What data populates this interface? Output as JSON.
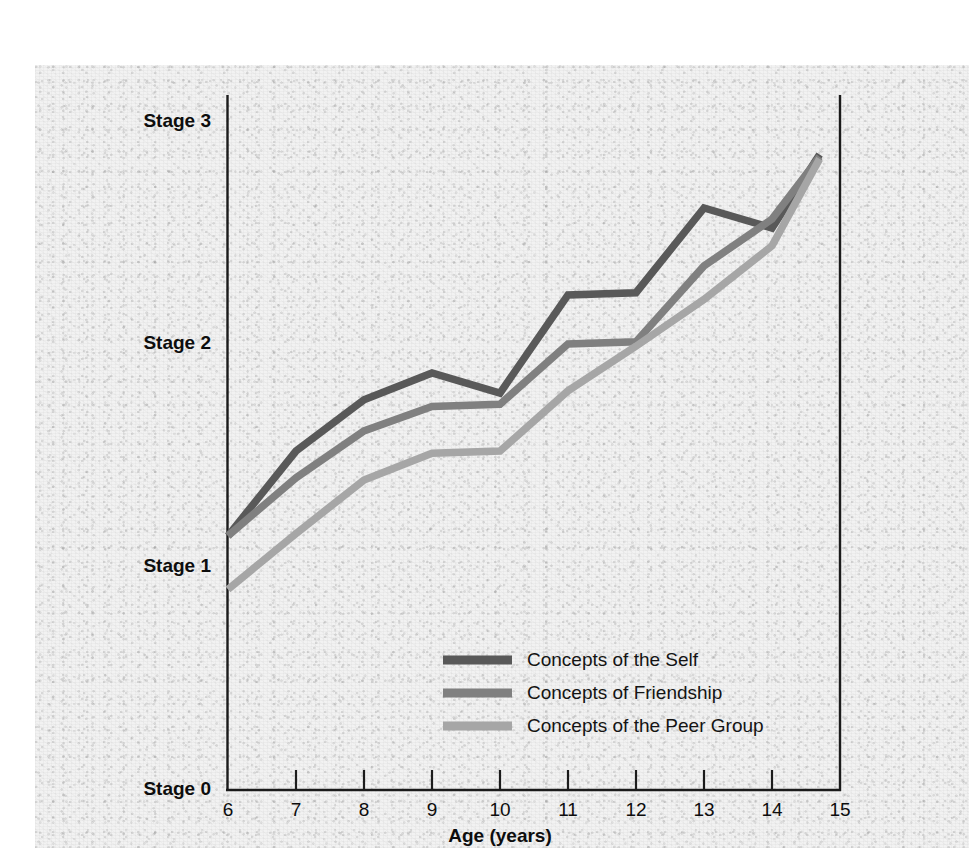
{
  "chart_data": {
    "type": "line",
    "title": "",
    "xlabel": "Age (years)",
    "ylabel": "",
    "x": [
      6,
      7,
      8,
      9,
      10,
      11,
      12,
      13,
      14,
      14.7
    ],
    "xlim": [
      6,
      15
    ],
    "ylim": [
      0,
      3
    ],
    "grid": false,
    "legend_position": "inside-bottom-center",
    "xtick_labels": [
      "6",
      "7",
      "8",
      "9",
      "10",
      "11",
      "12",
      "13",
      "14",
      "15"
    ],
    "ytick_labels": [
      "Stage 0",
      "Stage 1",
      "Stage 2",
      "Stage 3"
    ],
    "ytick_values": [
      0,
      1,
      2,
      3
    ],
    "series": [
      {
        "name": "Concepts of the Self",
        "color": "#595959",
        "values": [
          1.14,
          1.52,
          1.75,
          1.87,
          1.78,
          2.22,
          2.23,
          2.61,
          2.52,
          2.85
        ]
      },
      {
        "name": "Concepts of Friendship",
        "color": "#808080",
        "values": [
          1.14,
          1.4,
          1.61,
          1.72,
          1.73,
          2.0,
          2.01,
          2.35,
          2.56,
          2.84
        ]
      },
      {
        "name": "Concepts of the Peer Group",
        "color": "#a6a6a6",
        "values": [
          0.9,
          1.15,
          1.39,
          1.51,
          1.52,
          1.79,
          1.99,
          2.2,
          2.44,
          2.83
        ]
      }
    ]
  },
  "yaxis": {
    "labels": [
      {
        "text": "Stage 3",
        "value": 3
      },
      {
        "text": "Stage 2",
        "value": 2
      },
      {
        "text": "Stage 1",
        "value": 1
      },
      {
        "text": "Stage 0",
        "value": 0
      }
    ]
  },
  "xaxis": {
    "title": "Age (years)",
    "ticks": [
      "6",
      "7",
      "8",
      "9",
      "10",
      "11",
      "12",
      "13",
      "14",
      "15"
    ]
  },
  "legend": {
    "entries": [
      {
        "label": "Concepts of the Self",
        "color": "#595959"
      },
      {
        "label": "Concepts of Friendship",
        "color": "#808080"
      },
      {
        "label": "Concepts of the Peer Group",
        "color": "#a6a6a6"
      }
    ]
  }
}
